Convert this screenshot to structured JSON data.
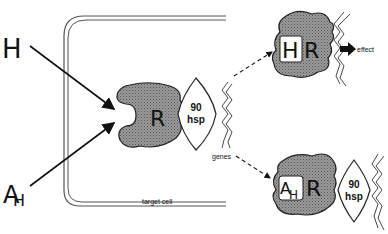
{
  "diagram": {
    "type": "steroid-hormone-receptor-mechanism",
    "labels": {
      "hormone": "H",
      "antihormone": "A",
      "antihormone_sub": "H",
      "receptor_center": "R",
      "hsp_top": "90",
      "hsp_bottom": "hsp",
      "genes": "genes",
      "effect": "effect",
      "target_cell": "target cell",
      "receptor_active_h": "H",
      "receptor_active_r": "R",
      "receptor_blocked_a": "A",
      "receptor_blocked_h": "H",
      "receptor_blocked_r": "R",
      "hsp2_top": "90",
      "hsp2_bottom": "hsp"
    },
    "colors": {
      "receptor_fill": "#8a8a8a",
      "line": "#111111",
      "membrane": "#555555",
      "background": "#ffffff"
    }
  }
}
